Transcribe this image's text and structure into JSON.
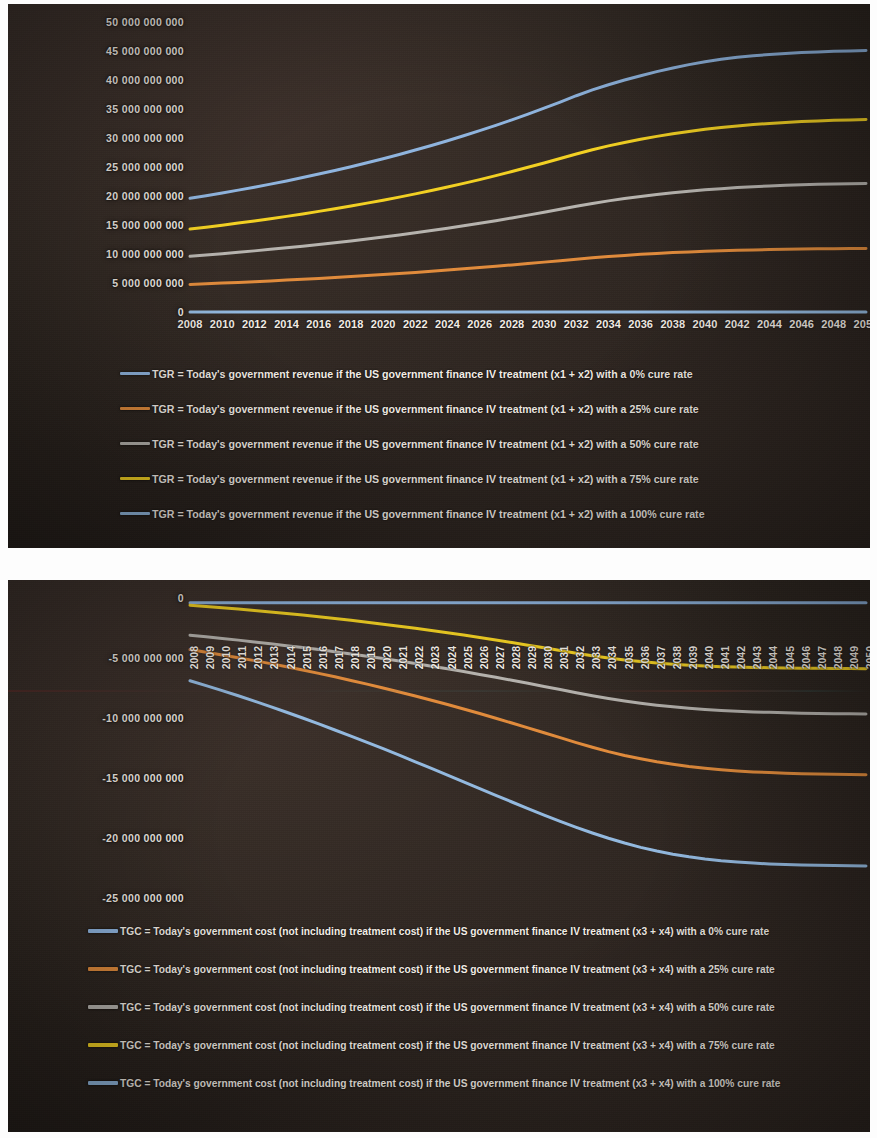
{
  "colors": {
    "series_blue": "#8FB4DE",
    "series_orange": "#E08B3C",
    "series_gray": "#B6B3AE",
    "series_yellow": "#F2D023",
    "series_lightblue": "#93B9DF",
    "panel_background": "#2E2620",
    "text": "#F2ECE5"
  },
  "chart_data": [
    {
      "type": "line",
      "title": "",
      "xlabel": "",
      "ylabel": "",
      "grid": false,
      "legend_position": "bottom",
      "ylim": [
        0,
        50000000000
      ],
      "ytick_labels": [
        "50 000 000 000",
        "45 000 000 000",
        "40 000 000 000",
        "35 000 000 000",
        "30 000 000 000",
        "25 000 000 000",
        "20 000 000 000",
        "15 000 000 000",
        "10 000 000 000",
        "5 000 000 000",
        "0"
      ],
      "ytick_values": [
        50000000000,
        45000000000,
        40000000000,
        35000000000,
        30000000000,
        25000000000,
        20000000000,
        15000000000,
        10000000000,
        5000000000,
        0
      ],
      "xtick_labels": [
        "2008",
        "2010",
        "2012",
        "2014",
        "2016",
        "2018",
        "2020",
        "2022",
        "2024",
        "2026",
        "2028",
        "2030",
        "2032",
        "2034",
        "2036",
        "2038",
        "2040",
        "2042",
        "2044",
        "2046",
        "2048",
        "2050"
      ],
      "x": [
        2008,
        2009,
        2010,
        2011,
        2012,
        2013,
        2014,
        2015,
        2016,
        2017,
        2018,
        2019,
        2020,
        2021,
        2022,
        2023,
        2024,
        2025,
        2026,
        2027,
        2028,
        2029,
        2030,
        2031,
        2032,
        2033,
        2034,
        2035,
        2036,
        2037,
        2038,
        2039,
        2040,
        2041,
        2042,
        2043,
        2044,
        2045,
        2046,
        2047,
        2048,
        2049,
        2050
      ],
      "series": [
        {
          "name": "TGR = Today's government revenue if the US government finance IV treatment (x1 + x2) with a 0% cure rate",
          "color": "#8FB4DE",
          "values": [
            19600000000,
            20050000000,
            20520000000,
            21010000000,
            21520000000,
            22050000000,
            22600000000,
            23180000000,
            23780000000,
            24400000000,
            25050000000,
            25730000000,
            26430000000,
            27160000000,
            27920000000,
            28710000000,
            29530000000,
            30380000000,
            31260000000,
            32180000000,
            33130000000,
            34120000000,
            35140000000,
            36200000000,
            37290000000,
            38290000000,
            39180000000,
            39990000000,
            40740000000,
            41440000000,
            42080000000,
            42650000000,
            43150000000,
            43570000000,
            43910000000,
            44180000000,
            44400000000,
            44580000000,
            44720000000,
            44840000000,
            44940000000,
            45020000000,
            45080000000
          ]
        },
        {
          "name": "TGR = Today's government revenue if the US government finance IV treatment (x1 + x2) with a 25% cure rate",
          "color": "#E08B3C",
          "values": [
            4750000000,
            4860000000,
            4980000000,
            5100000000,
            5230000000,
            5360000000,
            5500000000,
            5640000000,
            5790000000,
            5950000000,
            6110000000,
            6280000000,
            6460000000,
            6640000000,
            6830000000,
            7030000000,
            7230000000,
            7440000000,
            7660000000,
            7890000000,
            8120000000,
            8360000000,
            8600000000,
            8850000000,
            9100000000,
            9340000000,
            9560000000,
            9760000000,
            9940000000,
            10100000000,
            10240000000,
            10360000000,
            10470000000,
            10560000000,
            10640000000,
            10710000000,
            10770000000,
            10820000000,
            10860000000,
            10890000000,
            10920000000,
            10940000000,
            10960000000
          ]
        },
        {
          "name": "TGR = Today's government revenue if the US government finance IV treatment (x1 + x2) with a 50% cure rate",
          "color": "#B6B3AE",
          "values": [
            9600000000,
            9820000000,
            10050000000,
            10290000000,
            10540000000,
            10800000000,
            11070000000,
            11350000000,
            11640000000,
            11940000000,
            12260000000,
            12590000000,
            12930000000,
            13290000000,
            13660000000,
            14050000000,
            14450000000,
            14870000000,
            15300000000,
            15750000000,
            16220000000,
            16700000000,
            17200000000,
            17710000000,
            18230000000,
            18720000000,
            19160000000,
            19560000000,
            19920000000,
            20250000000,
            20550000000,
            20820000000,
            21060000000,
            21270000000,
            21450000000,
            21610000000,
            21740000000,
            21850000000,
            21940000000,
            22020000000,
            22080000000,
            22130000000,
            22170000000
          ]
        },
        {
          "name": "TGR = Today's government revenue if the US government finance IV treatment (x1 + x2) with a 75% cure rate",
          "color": "#F2D023",
          "values": [
            14300000000,
            14630000000,
            14970000000,
            15330000000,
            15700000000,
            16090000000,
            16490000000,
            16910000000,
            17350000000,
            17800000000,
            18270000000,
            18770000000,
            19280000000,
            19810000000,
            20370000000,
            20950000000,
            21550000000,
            22180000000,
            22830000000,
            23510000000,
            24220000000,
            24950000000,
            25700000000,
            26470000000,
            27250000000,
            27980000000,
            28640000000,
            29240000000,
            29780000000,
            30280000000,
            30730000000,
            31130000000,
            31490000000,
            31810000000,
            32080000000,
            32320000000,
            32520000000,
            32690000000,
            32830000000,
            32950000000,
            33050000000,
            33120000000,
            33180000000
          ]
        },
        {
          "name": "TGR = Today's government revenue if the US government finance IV treatment (x1 + x2) with a 100% cure rate",
          "color": "#93B9DF",
          "values": [
            0,
            0,
            0,
            0,
            0,
            0,
            0,
            0,
            0,
            0,
            0,
            0,
            0,
            0,
            0,
            0,
            0,
            0,
            0,
            0,
            0,
            0,
            0,
            0,
            0,
            0,
            0,
            0,
            0,
            0,
            0,
            0,
            0,
            0,
            0,
            0,
            0,
            0,
            0,
            0,
            0,
            0,
            0
          ]
        }
      ]
    },
    {
      "type": "line",
      "title": "",
      "xlabel": "",
      "ylabel": "",
      "grid": false,
      "legend_position": "bottom",
      "ylim": [
        -25000000000,
        0
      ],
      "ytick_labels": [
        "0",
        "-5 000 000 000",
        "-10 000 000 000",
        "-15 000 000 000",
        "-20 000 000 000",
        "-25 000 000 000"
      ],
      "ytick_values": [
        0,
        -5000000000,
        -10000000000,
        -15000000000,
        -20000000000,
        -25000000000
      ],
      "xtick_labels": [
        "2008",
        "2009",
        "2010",
        "2011",
        "2012",
        "2013",
        "2014",
        "2015",
        "2016",
        "2017",
        "2018",
        "2019",
        "2020",
        "2021",
        "2022",
        "2023",
        "2024",
        "2025",
        "2026",
        "2027",
        "2028",
        "2029",
        "2030",
        "2031",
        "2032",
        "2033",
        "2034",
        "2035",
        "2036",
        "2037",
        "2038",
        "2039",
        "2040",
        "2041",
        "2042",
        "2043",
        "2044",
        "2045",
        "2046",
        "2047",
        "2048",
        "2049",
        "2050"
      ],
      "x": [
        2008,
        2009,
        2010,
        2011,
        2012,
        2013,
        2014,
        2015,
        2016,
        2017,
        2018,
        2019,
        2020,
        2021,
        2022,
        2023,
        2024,
        2025,
        2026,
        2027,
        2028,
        2029,
        2030,
        2031,
        2032,
        2033,
        2034,
        2035,
        2036,
        2037,
        2038,
        2039,
        2040,
        2041,
        2042,
        2043,
        2044,
        2045,
        2046,
        2047,
        2048,
        2049,
        2050
      ],
      "series": [
        {
          "name": "TGC = Today's government cost (not including treatment cost) if the US government finance IV treatment (x3 + x4) with a 0% cure rate",
          "color": "#8FB4DE",
          "values": [
            -400000000,
            -400000000,
            -400000000,
            -400000000,
            -400000000,
            -400000000,
            -400000000,
            -400000000,
            -400000000,
            -400000000,
            -400000000,
            -400000000,
            -400000000,
            -400000000,
            -400000000,
            -400000000,
            -400000000,
            -400000000,
            -400000000,
            -400000000,
            -400000000,
            -400000000,
            -400000000,
            -400000000,
            -400000000,
            -400000000,
            -400000000,
            -400000000,
            -400000000,
            -400000000,
            -400000000,
            -400000000,
            -400000000,
            -400000000,
            -400000000,
            -400000000,
            -400000000,
            -400000000,
            -400000000,
            -400000000,
            -400000000,
            -400000000,
            -400000000
          ]
        },
        {
          "name": "TGC = Today's government cost (not including treatment cost) if the US government finance IV treatment (x3 + x4) with a 25% cure rate",
          "color": "#E08B3C",
          "values": [
            -4300000000,
            -4520000000,
            -4750000000,
            -4980000000,
            -5220000000,
            -5470000000,
            -5730000000,
            -6000000000,
            -6280000000,
            -6570000000,
            -6870000000,
            -7180000000,
            -7500000000,
            -7830000000,
            -8170000000,
            -8520000000,
            -8880000000,
            -9250000000,
            -9630000000,
            -10020000000,
            -10420000000,
            -10820000000,
            -11230000000,
            -11640000000,
            -12050000000,
            -12440000000,
            -12800000000,
            -13120000000,
            -13400000000,
            -13650000000,
            -13860000000,
            -14040000000,
            -14190000000,
            -14310000000,
            -14410000000,
            -14490000000,
            -14550000000,
            -14600000000,
            -14640000000,
            -14670000000,
            -14690000000,
            -14710000000,
            -14720000000
          ]
        },
        {
          "name": "TGC = Today's government cost (not including treatment cost) if the US government finance IV treatment (x3 + x4) with a 50% cure rate",
          "color": "#B6B3AE",
          "values": [
            -3100000000,
            -3230000000,
            -3370000000,
            -3510000000,
            -3660000000,
            -3810000000,
            -3970000000,
            -4130000000,
            -4300000000,
            -4480000000,
            -4660000000,
            -4850000000,
            -5050000000,
            -5250000000,
            -5460000000,
            -5680000000,
            -5900000000,
            -6130000000,
            -6370000000,
            -6610000000,
            -6860000000,
            -7110000000,
            -7370000000,
            -7630000000,
            -7890000000,
            -8140000000,
            -8370000000,
            -8580000000,
            -8770000000,
            -8930000000,
            -9070000000,
            -9190000000,
            -9290000000,
            -9370000000,
            -9440000000,
            -9490000000,
            -9530000000,
            -9570000000,
            -9600000000,
            -9620000000,
            -9640000000,
            -9650000000,
            -9660000000
          ]
        },
        {
          "name": "TGC = Today's government cost (not including treatment cost) if the US government finance IV treatment (x3 + x4) with a 75% cure rate",
          "color": "#F2D023",
          "values": [
            -600000000,
            -700000000,
            -810000000,
            -920000000,
            -1040000000,
            -1160000000,
            -1290000000,
            -1420000000,
            -1560000000,
            -1710000000,
            -1860000000,
            -2020000000,
            -2180000000,
            -2350000000,
            -2530000000,
            -2710000000,
            -2900000000,
            -3090000000,
            -3290000000,
            -3500000000,
            -3710000000,
            -3930000000,
            -4150000000,
            -4380000000,
            -4600000000,
            -4810000000,
            -5000000000,
            -5160000000,
            -5300000000,
            -5420000000,
            -5520000000,
            -5600000000,
            -5670000000,
            -5720000000,
            -5760000000,
            -5790000000,
            -5810000000,
            -5830000000,
            -5850000000,
            -5860000000,
            -5870000000,
            -5880000000,
            -5890000000
          ]
        },
        {
          "name": "TGC = Today's government cost (not including treatment cost) if the US government finance IV treatment (x3 + x4) with a 100% cure rate",
          "color": "#93B9DF",
          "values": [
            -6900000000,
            -7300000000,
            -7720000000,
            -8150000000,
            -8590000000,
            -9050000000,
            -9520000000,
            -10000000000,
            -10490000000,
            -11000000000,
            -11510000000,
            -12030000000,
            -12560000000,
            -13100000000,
            -13650000000,
            -14200000000,
            -14760000000,
            -15320000000,
            -15880000000,
            -16440000000,
            -17000000000,
            -17550000000,
            -18090000000,
            -18610000000,
            -19110000000,
            -19580000000,
            -20020000000,
            -20420000000,
            -20780000000,
            -21090000000,
            -21350000000,
            -21570000000,
            -21750000000,
            -21890000000,
            -22000000000,
            -22090000000,
            -22160000000,
            -22210000000,
            -22250000000,
            -22280000000,
            -22300000000,
            -22320000000,
            -22330000000
          ]
        }
      ]
    }
  ]
}
